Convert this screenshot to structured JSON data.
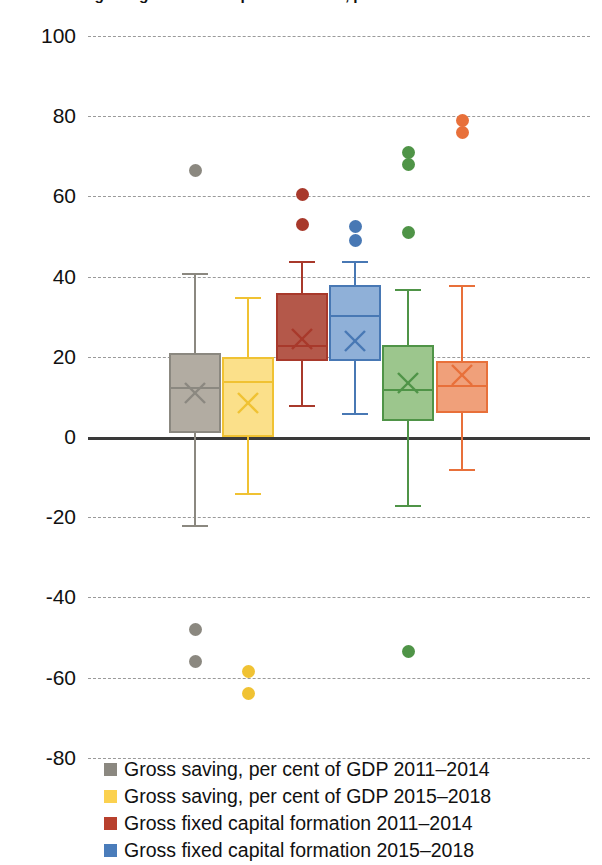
{
  "chart": {
    "title": "Gross saving and gross fixed capital formation, per cent of GDP",
    "type": "box",
    "ylabel": "",
    "xlabel": "",
    "ylim": [
      -80,
      100
    ],
    "ytick_labels": [
      "100",
      "80",
      "60",
      "40",
      "20",
      "0",
      "-20",
      "-40",
      "-60",
      "-80"
    ],
    "ytick_values": [
      100,
      80,
      60,
      40,
      20,
      0,
      -20,
      -40,
      -60,
      -80
    ],
    "grid": true,
    "zero_line": true,
    "legend_position": "bottom"
  },
  "chart_data": {
    "type": "box",
    "title": "Gross saving and gross fixed capital formation, per cent of GDP",
    "ylim": [
      -80,
      100
    ],
    "ytick_labels": [
      "100",
      "80",
      "60",
      "40",
      "20",
      "0",
      "-20",
      "-40",
      "-60",
      "-80"
    ],
    "series": [
      {
        "name": "Gross saving, per cent of GDP 2011–2014",
        "color": "#8b8880",
        "fill": "#b2aca2",
        "whisker_low": -22,
        "q1": 1,
        "median": 12.5,
        "q3": 21,
        "whisker_high": 41,
        "mean": 11,
        "outliers": [
          66.5,
          -48,
          -56
        ]
      },
      {
        "name": "Gross saving, per cent of GDP 2015–2018",
        "color": "#f0c233",
        "fill": "#fbe08a",
        "whisker_low": -14,
        "q1": 0,
        "median": 14,
        "q3": 20,
        "whisker_high": 35,
        "mean": 8.5,
        "outliers": [
          -58.5,
          -64
        ]
      },
      {
        "name": "Gross fixed capital formation 2011–2014",
        "color": "#a8392b",
        "fill": "#b4584a",
        "whisker_low": 8,
        "q1": 19,
        "median": 23,
        "q3": 36,
        "whisker_high": 44,
        "mean": 24.5,
        "outliers": [
          60.5,
          53
        ]
      },
      {
        "name": "Gross fixed capital formation 2015–2018",
        "color": "#4878b4",
        "fill": "#8fb0d8",
        "whisker_low": 6,
        "q1": 19,
        "median": 30.5,
        "q3": 38,
        "whisker_high": 44,
        "mean": 24,
        "outliers": [
          52.5,
          49
        ]
      },
      {
        "name": "Gross saving, per cent of GDP 2011–2014 (green)",
        "color": "#4f9447",
        "fill": "#9cc68d",
        "whisker_low": -17,
        "q1": 4,
        "median": 12,
        "q3": 23,
        "whisker_high": 37,
        "mean": 13.5,
        "outliers": [
          71,
          68,
          51,
          -53.5
        ]
      },
      {
        "name": "Gross fixed capital formation 2015–2018 (orange)",
        "color": "#e8703a",
        "fill": "#f0a07a",
        "whisker_low": -8,
        "q1": 6,
        "median": 13,
        "q3": 19,
        "whisker_high": 38,
        "mean": 15.5,
        "outliers": [
          79,
          76
        ]
      }
    ]
  },
  "legend": {
    "items": [
      {
        "label": "Gross saving, per cent of GDP 2011–2014",
        "color": "#8b8880"
      },
      {
        "label": "Gross saving, per cent of GDP 2015–2018",
        "color": "#fbd14f"
      },
      {
        "label": "Gross fixed capital formation 2011–2014",
        "color": "#b8402d"
      },
      {
        "label": "Gross fixed capital formation 2015–2018",
        "color": "#4a7cba"
      }
    ]
  }
}
